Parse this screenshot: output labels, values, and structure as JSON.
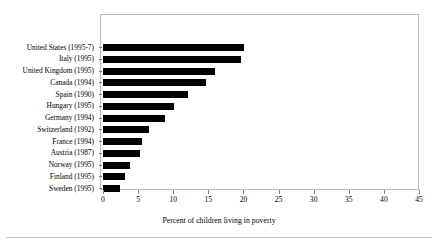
{
  "chart_data": {
    "type": "bar",
    "orientation": "horizontal",
    "title": "",
    "subtitle": "",
    "xlabel": "Percent of children living in poverty",
    "ylabel": "",
    "xlim": [
      0,
      45
    ],
    "xticks": [
      0,
      5,
      10,
      15,
      20,
      25,
      30,
      35,
      40,
      45
    ],
    "xtick_labels": [
      "0",
      "5",
      "10",
      "15",
      "20",
      "25",
      "30",
      "35",
      "40",
      "45"
    ],
    "grid": false,
    "legend": null,
    "bar_color": "#000000",
    "frame_color": "#b9b9b9",
    "categories": [
      "United States (1995-7)",
      "Italy (1995)",
      "United Kingdom (1995)",
      "Canada (1994)",
      "Spain (1990)",
      "Hungary (1995)",
      "Germany (1994)",
      "Switzerland (1992)",
      "France (1994)",
      "Austria (1987)",
      "Norway (1995)",
      "Finland (1995)",
      "Sweden (1995)"
    ],
    "values": [
      20.1,
      19.7,
      16.0,
      14.6,
      12.1,
      10.1,
      8.8,
      6.5,
      5.6,
      5.3,
      3.9,
      3.2,
      2.4
    ]
  }
}
